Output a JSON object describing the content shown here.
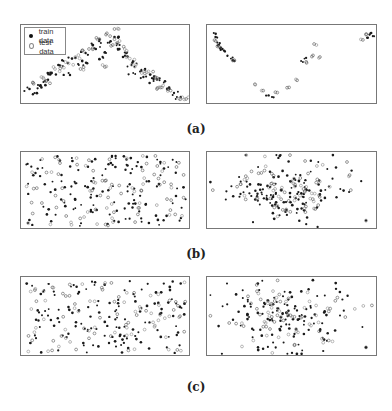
{
  "figure": {
    "captions": [
      "(a)",
      "(b)",
      "(c)"
    ],
    "legend": {
      "train_label": "train data",
      "test_label": "test data"
    },
    "colors": {
      "train": "#1a1a1a",
      "test": "#8a8a8a",
      "border": "#777777"
    }
  },
  "chart_data": [
    {
      "type": "scatter",
      "panel": "a-left",
      "title": "",
      "xlabel": "",
      "ylabel": "",
      "legend_position": "upper-left",
      "grid": false,
      "description": "Arch (inverted-U) shaped cloud of train (filled dots) and test (open circles) points rising from lower-left to a peak near center-top and descending to lower-right",
      "series": [
        {
          "name": "train data",
          "marker": "filled",
          "points": [
            [
              0.05,
              0.8
            ],
            [
              0.08,
              0.85
            ],
            [
              0.1,
              0.75
            ],
            [
              0.14,
              0.7
            ],
            [
              0.16,
              0.62
            ],
            [
              0.18,
              0.6
            ],
            [
              0.22,
              0.5
            ],
            [
              0.25,
              0.45
            ],
            [
              0.3,
              0.42
            ],
            [
              0.34,
              0.5
            ],
            [
              0.38,
              0.35
            ],
            [
              0.42,
              0.25
            ],
            [
              0.44,
              0.3
            ],
            [
              0.46,
              0.2
            ],
            [
              0.5,
              0.35
            ],
            [
              0.52,
              0.22
            ],
            [
              0.55,
              0.15
            ],
            [
              0.57,
              0.3
            ],
            [
              0.6,
              0.4
            ],
            [
              0.62,
              0.35
            ],
            [
              0.65,
              0.5
            ],
            [
              0.68,
              0.48
            ],
            [
              0.7,
              0.58
            ],
            [
              0.73,
              0.55
            ],
            [
              0.76,
              0.62
            ],
            [
              0.8,
              0.68
            ],
            [
              0.84,
              0.72
            ],
            [
              0.86,
              0.8
            ],
            [
              0.9,
              0.85
            ],
            [
              0.94,
              0.9
            ],
            [
              0.28,
              0.6
            ],
            [
              0.48,
              0.4
            ],
            [
              0.58,
              0.25
            ],
            [
              0.66,
              0.6
            ],
            [
              0.78,
              0.7
            ],
            [
              0.12,
              0.78
            ],
            [
              0.36,
              0.45
            ],
            [
              0.72,
              0.65
            ]
          ]
        },
        {
          "name": "test data",
          "marker": "open",
          "points": [
            [
              0.07,
              0.72
            ],
            [
              0.12,
              0.65
            ],
            [
              0.15,
              0.7
            ],
            [
              0.2,
              0.55
            ],
            [
              0.24,
              0.52
            ],
            [
              0.28,
              0.48
            ],
            [
              0.32,
              0.4
            ],
            [
              0.36,
              0.32
            ],
            [
              0.4,
              0.3
            ],
            [
              0.45,
              0.18
            ],
            [
              0.5,
              0.12
            ],
            [
              0.54,
              0.25
            ],
            [
              0.58,
              0.2
            ],
            [
              0.61,
              0.3
            ],
            [
              0.64,
              0.42
            ],
            [
              0.67,
              0.52
            ],
            [
              0.71,
              0.6
            ],
            [
              0.75,
              0.58
            ],
            [
              0.79,
              0.65
            ],
            [
              0.83,
              0.78
            ],
            [
              0.88,
              0.82
            ],
            [
              0.93,
              0.92
            ],
            [
              0.96,
              0.93
            ],
            [
              0.35,
              0.55
            ],
            [
              0.55,
              0.05
            ],
            [
              0.48,
              0.5
            ],
            [
              0.8,
              0.8
            ]
          ]
        }
      ]
    },
    {
      "type": "scatter",
      "panel": "a-right",
      "title": "",
      "xlabel": "",
      "ylabel": "",
      "description": "Sparse V-shaped arrangement: dense cluster top-left, descending diagonal to bottom center, rising to cluster top-right",
      "series": [
        {
          "name": "train data",
          "marker": "filled",
          "points": [
            [
              0.04,
              0.1
            ],
            [
              0.05,
              0.15
            ],
            [
              0.06,
              0.22
            ],
            [
              0.07,
              0.25
            ],
            [
              0.08,
              0.28
            ],
            [
              0.09,
              0.3
            ],
            [
              0.1,
              0.32
            ],
            [
              0.12,
              0.38
            ],
            [
              0.14,
              0.42
            ],
            [
              0.16,
              0.45
            ],
            [
              0.36,
              0.88
            ],
            [
              0.38,
              0.9
            ],
            [
              0.55,
              0.45
            ],
            [
              0.57,
              0.42
            ],
            [
              0.95,
              0.12
            ],
            [
              0.96,
              0.1
            ],
            [
              0.97,
              0.14
            ],
            [
              0.94,
              0.16
            ]
          ]
        },
        {
          "name": "test data",
          "marker": "open",
          "points": [
            [
              0.05,
              0.2
            ],
            [
              0.07,
              0.27
            ],
            [
              0.16,
              0.44
            ],
            [
              0.28,
              0.74
            ],
            [
              0.32,
              0.82
            ],
            [
              0.4,
              0.84
            ],
            [
              0.48,
              0.78
            ],
            [
              0.52,
              0.68
            ],
            [
              0.58,
              0.46
            ],
            [
              0.62,
              0.38
            ],
            [
              0.64,
              0.25
            ],
            [
              0.66,
              0.4
            ],
            [
              0.9,
              0.18
            ],
            [
              0.93,
              0.12
            ]
          ]
        }
      ]
    },
    {
      "type": "scatter",
      "panel": "b-left",
      "title": "",
      "xlabel": "",
      "ylabel": "",
      "description": "Diffuse uniform-looking cloud of intermixed train and test points across the panel",
      "series": [
        {
          "name": "train data",
          "marker": "filled",
          "points": "random-uniform (~140 points)"
        },
        {
          "name": "test data",
          "marker": "open",
          "points": "random-uniform (~90 points)"
        }
      ]
    },
    {
      "type": "scatter",
      "panel": "b-right",
      "title": "",
      "xlabel": "",
      "ylabel": "",
      "description": "Roughly Gaussian cloud centered around x~0.45, y~0.5 with sparse outliers, empty right third",
      "series": [
        {
          "name": "train data",
          "marker": "filled",
          "points": "gaussian (~130 points)"
        },
        {
          "name": "test data",
          "marker": "open",
          "points": "gaussian (~80 points)"
        }
      ]
    },
    {
      "type": "scatter",
      "panel": "c-left",
      "title": "",
      "xlabel": "",
      "ylabel": "",
      "description": "Diffuse uniform-looking cloud of intermixed train and test points",
      "series": [
        {
          "name": "train data",
          "marker": "filled",
          "points": "random-uniform (~140 points)"
        },
        {
          "name": "test data",
          "marker": "open",
          "points": "random-uniform (~90 points)"
        }
      ]
    },
    {
      "type": "scatter",
      "panel": "c-right",
      "title": "",
      "xlabel": "",
      "ylabel": "",
      "description": "Roughly Gaussian cloud centered around x~0.45, y~0.45 with sparse outliers, empty right third",
      "series": [
        {
          "name": "train data",
          "marker": "filled",
          "points": "gaussian (~130 points)"
        },
        {
          "name": "test data",
          "marker": "open",
          "points": "gaussian (~80 points)"
        }
      ]
    }
  ]
}
